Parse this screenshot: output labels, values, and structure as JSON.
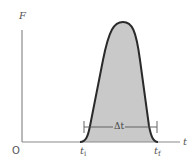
{
  "diagram": {
    "axes": {
      "y_label": "F",
      "x_label": "t",
      "origin_label": "O"
    },
    "markers": {
      "t_initial": {
        "symbol": "t",
        "subscript": "i"
      },
      "t_final": {
        "symbol": "t",
        "subscript": "f"
      }
    },
    "interval_label": "Δt",
    "colors": {
      "axis": "#8a8a8a",
      "curve": "#2a2a2a",
      "fill": "#c9c9c9",
      "text": "#555555"
    }
  }
}
